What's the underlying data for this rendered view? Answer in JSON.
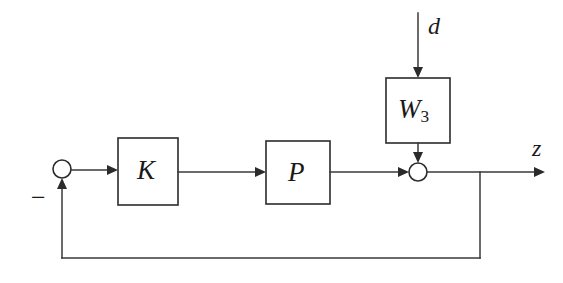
{
  "diagram": {
    "background_color": "#ffffff",
    "line_color": "#3a3a3a",
    "text_color": "#1a1a1a",
    "blocks": [
      {
        "id": "controller",
        "label": "K",
        "x": 118,
        "y": 138,
        "width": 60,
        "height": 67
      },
      {
        "id": "plant",
        "label": "P",
        "x": 266,
        "y": 141,
        "width": 64,
        "height": 63
      },
      {
        "id": "weight",
        "label_main": "W",
        "label_sub": "3",
        "x": 386,
        "y": 78,
        "width": 64,
        "height": 65
      }
    ],
    "summing_junctions": [
      {
        "id": "error-junction",
        "cx": 62,
        "cy": 169,
        "r": 9,
        "sign": "−"
      },
      {
        "id": "output-junction",
        "cx": 418,
        "cy": 172,
        "r": 9
      }
    ],
    "signals": [
      {
        "id": "disturbance",
        "label": "d"
      },
      {
        "id": "performance-output",
        "label": "z"
      }
    ],
    "feedback": {
      "tap_x": 480,
      "bottom_y": 258
    }
  }
}
